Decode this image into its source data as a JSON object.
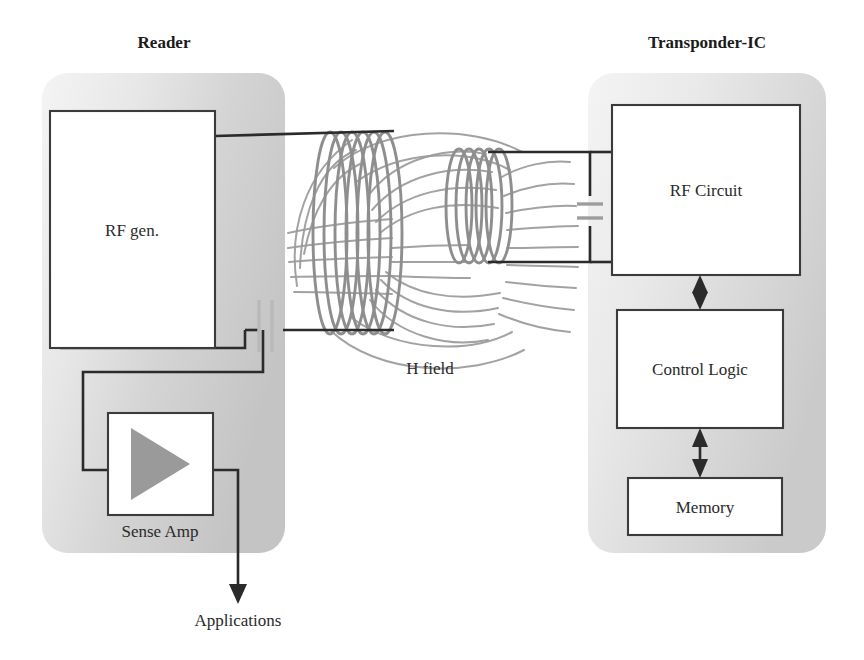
{
  "figure": {
    "kind": "rfid-inductive-coupling-block-diagram",
    "background_color": "#ffffff"
  },
  "reader": {
    "title": "Reader",
    "panel_fill_from": "#f0f0f0",
    "panel_fill_to": "#c9c9c9",
    "blocks": [
      {
        "id": "rf-gen",
        "label": "RF gen."
      },
      {
        "id": "sense-amp",
        "label": "Sense Amp"
      }
    ],
    "sense_amp_symbol": "amplifier-triangle-icon"
  },
  "transponder": {
    "title": "Transponder-IC",
    "panel_fill_from": "#f2f2f2",
    "panel_fill_to": "#cfcfcf",
    "blocks": [
      {
        "id": "rf-circuit",
        "label": "RF Circuit"
      },
      {
        "id": "control-logic",
        "label": "Control Logic"
      },
      {
        "id": "memory",
        "label": "Memory"
      }
    ]
  },
  "coupling": {
    "field_label": "H field",
    "field_line_color": "#9a9a9a",
    "coil_color": "#8e8e8e",
    "reader_coil_turns": 6,
    "transponder_coil_turns": 5
  },
  "output": {
    "label": "Applications",
    "arrow": "down-arrow-icon"
  },
  "components": {
    "reader_capacitor": "capacitor-icon",
    "transponder_capacitor": "capacitor-icon",
    "bus_arrows": "double-headed-arrow-icon"
  }
}
